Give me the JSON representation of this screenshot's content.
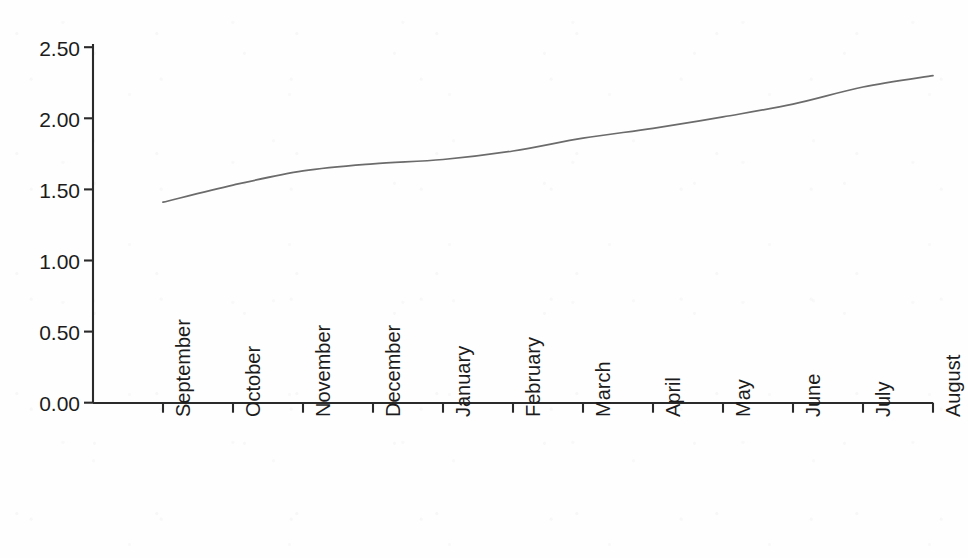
{
  "chart_data": {
    "type": "line",
    "title": "",
    "subtitle": "",
    "xlabel": "",
    "ylabel": "",
    "categories": [
      "September",
      "October",
      "November",
      "December",
      "January",
      "February",
      "March",
      "April",
      "May",
      "June",
      "July",
      "August"
    ],
    "series": [
      {
        "name": "",
        "values": [
          1.41,
          1.53,
          1.63,
          1.68,
          1.71,
          1.77,
          1.86,
          1.93,
          2.01,
          2.1,
          2.22,
          2.3
        ]
      }
    ],
    "ylim": [
      0.0,
      2.5
    ],
    "ytick_labels": [
      "0.00",
      "0.50",
      "1.00",
      "1.50",
      "2.00",
      "2.50"
    ],
    "ytick_values": [
      0.0,
      0.5,
      1.0,
      1.5,
      2.0,
      2.5
    ],
    "grid": false,
    "legend": false,
    "legend_position": "none",
    "line_color": "#6b6b6b",
    "axis_color": "#2a2a2a",
    "background_color": "#fefefe",
    "annotations": []
  },
  "axes": {
    "y_axis_name": "value-axis",
    "x_axis_name": "month-axis"
  }
}
